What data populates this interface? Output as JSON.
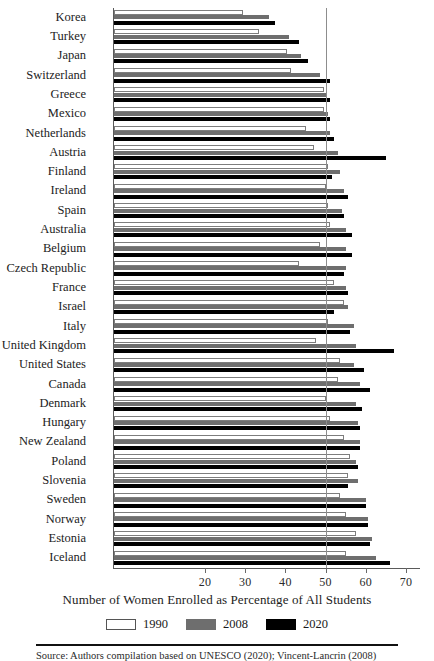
{
  "chart_data": {
    "type": "bar",
    "orientation": "horizontal",
    "title": "",
    "xlabel": "Number of Women Enrolled as Percentage of All Students",
    "ylabel": "",
    "xlim": [
      0,
      72
    ],
    "xticks": [
      20,
      30,
      40,
      50,
      60,
      70
    ],
    "reference_line": 50,
    "grid": false,
    "legend_position": "bottom",
    "categories": [
      "Korea",
      "Turkey",
      "Japan",
      "Switzerland",
      "Greece",
      "Mexico",
      "Netherlands",
      "Austria",
      "Finland",
      "Ireland",
      "Spain",
      "Australia",
      "Belgium",
      "Czech Republic",
      "France",
      "Israel",
      "Italy",
      "United Kingdom",
      "United States",
      "Canada",
      "Denmark",
      "Hungary",
      "New Zealand",
      "Poland",
      "Slovenia",
      "Sweden",
      "Norway",
      "Estonia",
      "Iceland"
    ],
    "series": [
      {
        "name": "1990",
        "color": "#ffffff",
        "values": [
          29.5,
          33.5,
          40.5,
          41.5,
          49.5,
          49.5,
          45.0,
          47.0,
          50.5,
          50.0,
          50.5,
          51.0,
          48.5,
          43.5,
          52.0,
          54.5,
          50.5,
          47.5,
          53.5,
          53.0,
          50.0,
          51.0,
          54.5,
          56.0,
          55.5,
          53.5,
          55.0,
          57.5,
          55.0
        ]
      },
      {
        "name": "2008",
        "color": "#6e6e6e",
        "values": [
          36.0,
          41.0,
          44.0,
          48.5,
          50.0,
          50.5,
          51.0,
          53.0,
          53.5,
          54.5,
          54.0,
          55.0,
          55.0,
          55.0,
          55.0,
          55.5,
          57.0,
          57.5,
          57.0,
          58.5,
          57.5,
          58.0,
          58.5,
          57.5,
          58.0,
          60.0,
          60.5,
          61.5,
          62.5
        ]
      },
      {
        "name": "2020",
        "color": "#000000",
        "values": [
          37.5,
          43.5,
          45.5,
          51.0,
          51.0,
          51.0,
          52.0,
          65.0,
          51.5,
          55.5,
          54.5,
          56.5,
          56.5,
          54.5,
          55.5,
          52.0,
          56.0,
          67.0,
          59.5,
          61.0,
          59.0,
          58.5,
          58.5,
          58.0,
          55.5,
          60.0,
          60.5,
          61.0,
          66.0
        ]
      }
    ]
  },
  "legend": {
    "items": [
      {
        "label": "1990",
        "swatch": "s1990"
      },
      {
        "label": "2008",
        "swatch": "s2008"
      },
      {
        "label": "2020",
        "swatch": "s2020"
      }
    ]
  },
  "footnote": {
    "text": "Source: Authors compilation based on UNESCO (2020); Vincent-Lancrin (2008)"
  }
}
